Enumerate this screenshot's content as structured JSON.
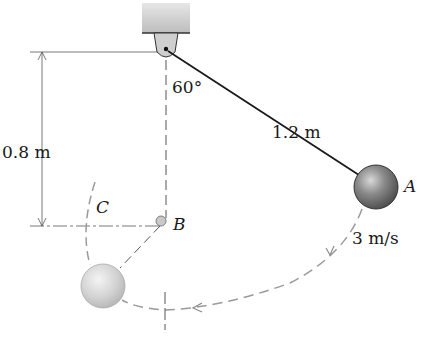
{
  "diagram": {
    "type": "pendulum-with-peg",
    "labels": {
      "angle": "60°",
      "length": "1.2 m",
      "drop": "0.8 m",
      "point_a": "A",
      "point_b": "B",
      "point_c": "C",
      "speed": "3 m/s"
    },
    "colors": {
      "line": "#1a1a1a",
      "dashed": "#9a9a9a",
      "support": "#c8c8c8",
      "ball_a": "#6e6e6e",
      "ball_c": "#d6d6d6"
    }
  }
}
